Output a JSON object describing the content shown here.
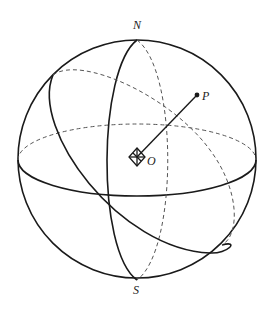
{
  "diagram": {
    "labels": {
      "north": "N",
      "south": "S",
      "center": "O",
      "point": "P"
    },
    "colors": {
      "line": "#1a1a1a",
      "hidden_line": "#555555",
      "background": "#ffffff"
    }
  }
}
